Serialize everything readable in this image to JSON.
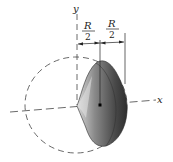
{
  "diagram": {
    "axes": {
      "x_label": "x",
      "y_label": "y"
    },
    "dimensions": [
      {
        "numerator": "R",
        "denominator": "2"
      },
      {
        "numerator": "R",
        "denominator": "2"
      }
    ],
    "shape": "hemispherical shell segment (half-dome) with centroid marker",
    "colors": {
      "body_dark": "#3c3c3c",
      "body_mid": "#7a7a7a",
      "body_light": "#c8c8c8",
      "lines": "#333333",
      "background": "#ffffff"
    }
  }
}
